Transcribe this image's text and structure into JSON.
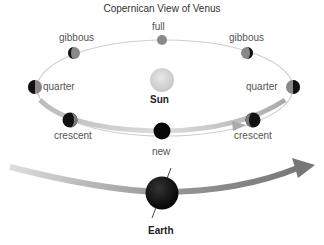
{
  "title": "Copernican View of Venus",
  "sun": {
    "label": "Sun",
    "color": "#d4d4d4"
  },
  "earth": {
    "label": "Earth",
    "color": "#111111"
  },
  "venus_phases": [
    {
      "id": "full",
      "label": "full"
    },
    {
      "id": "gibbous-left",
      "label": "gibbous"
    },
    {
      "id": "gibbous-right",
      "label": "gibbous"
    },
    {
      "id": "quarter-left",
      "label": "quarter"
    },
    {
      "id": "quarter-right",
      "label": "quarter"
    },
    {
      "id": "crescent-left",
      "label": "crescent"
    },
    {
      "id": "crescent-right",
      "label": "crescent"
    },
    {
      "id": "new",
      "label": "new"
    }
  ],
  "colors": {
    "orbit_line": "#c8c8c8",
    "orbit_arrow": "#b0b0b0",
    "earth_arrow": "#888888",
    "planet_dark": "#111111",
    "planet_lit": "#8a8a8a"
  }
}
